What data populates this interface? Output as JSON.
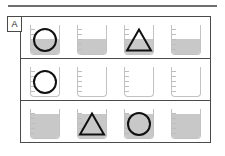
{
  "figure": {
    "panel_label": "A",
    "colors": {
      "liquid": "#c8c8c8",
      "beaker_outline": "#c2c2c2",
      "shape_outline": "#111111",
      "frame": "#4a4a4a",
      "rule": "#6f6f6f"
    },
    "rows": [
      {
        "row_name": "row-1",
        "cells": [
          {
            "beaker_name": "beaker-r1c1",
            "fill_percent": 50,
            "shape": "circle",
            "shape_name": "circle-shape"
          },
          {
            "beaker_name": "beaker-r1c2",
            "fill_percent": 50,
            "shape": "none",
            "shape_name": "no-shape"
          },
          {
            "beaker_name": "beaker-r1c3",
            "fill_percent": 50,
            "shape": "triangle",
            "shape_name": "triangle-shape"
          },
          {
            "beaker_name": "beaker-r1c4",
            "fill_percent": 50,
            "shape": "none",
            "shape_name": "no-shape"
          }
        ]
      },
      {
        "row_name": "row-2",
        "cells": [
          {
            "beaker_name": "beaker-r2c1",
            "fill_percent": 0,
            "shape": "circle",
            "shape_name": "circle-shape"
          },
          {
            "beaker_name": "beaker-r2c2",
            "fill_percent": 0,
            "shape": "none",
            "shape_name": "no-shape"
          },
          {
            "beaker_name": "beaker-r2c3",
            "fill_percent": 0,
            "shape": "none",
            "shape_name": "no-shape"
          },
          {
            "beaker_name": "beaker-r2c4",
            "fill_percent": 0,
            "shape": "none",
            "shape_name": "no-shape"
          }
        ]
      },
      {
        "row_name": "row-3",
        "cells": [
          {
            "beaker_name": "beaker-r3c1",
            "fill_percent": 82,
            "shape": "none",
            "shape_name": "no-shape"
          },
          {
            "beaker_name": "beaker-r3c2",
            "fill_percent": 82,
            "shape": "triangle",
            "shape_name": "triangle-shape"
          },
          {
            "beaker_name": "beaker-r3c3",
            "fill_percent": 82,
            "shape": "circle",
            "shape_name": "circle-shape"
          },
          {
            "beaker_name": "beaker-r3c4",
            "fill_percent": 82,
            "shape": "none",
            "shape_name": "no-shape"
          }
        ]
      }
    ]
  }
}
